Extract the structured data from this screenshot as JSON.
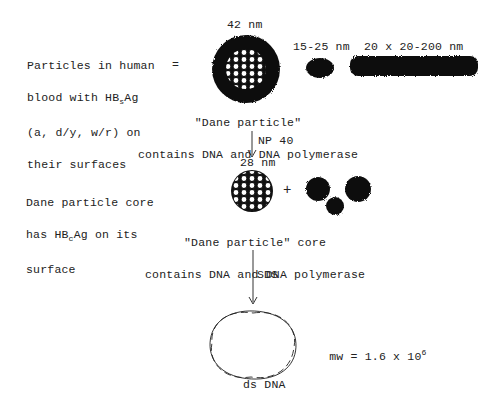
{
  "diagram": {
    "top_left_label": [
      "Particles in human",
      "blood with HBsAg",
      "(a, d/y, w/r) on",
      "their surfaces"
    ],
    "equals_sign": "=",
    "dane_particle_size": "42 nm",
    "spherical_size": "15-25 nm",
    "filament_size": "20 x 20-200 nm",
    "dane_particle_caption": [
      "\"Dane particle\"",
      "contains DNA and DNA polymerase"
    ],
    "step1_reagent": "NP 40",
    "core_label": [
      "Dane particle core",
      "has HBcAg on its",
      "surface"
    ],
    "core_size": "28 nm",
    "plus_sign": "+",
    "core_caption": [
      "\"Dane particle\" core",
      "contains DNA and DNA polymerase"
    ],
    "step2_reagent": "SDS",
    "mw_label": "mw = 1.6 x 10",
    "mw_exponent": "6",
    "dna_caption": "ds DNA"
  }
}
